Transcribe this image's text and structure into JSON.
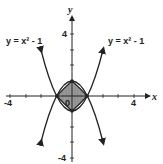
{
  "diagram": {
    "axes": {
      "x_label": "x",
      "y_label": "y",
      "x_ticks": {
        "neg": "-4",
        "pos": "4"
      },
      "y_ticks": {
        "pos": "4",
        "neg": "-4"
      },
      "origin_label": "0",
      "range": [
        -4,
        4
      ]
    },
    "curves": [
      {
        "label": "y = x² - 1",
        "position": "left"
      },
      {
        "label": "y = x² - 1",
        "position": "right"
      }
    ],
    "shaded_region": {
      "fill": "#9a9a9a",
      "vertices": [
        [
          0,
          1
        ],
        [
          1,
          0
        ],
        [
          0,
          -1
        ],
        [
          -1,
          0
        ]
      ]
    },
    "colors": {
      "stroke": "#222222",
      "shade": "#9a9a9a",
      "background": "#ffffff"
    }
  }
}
